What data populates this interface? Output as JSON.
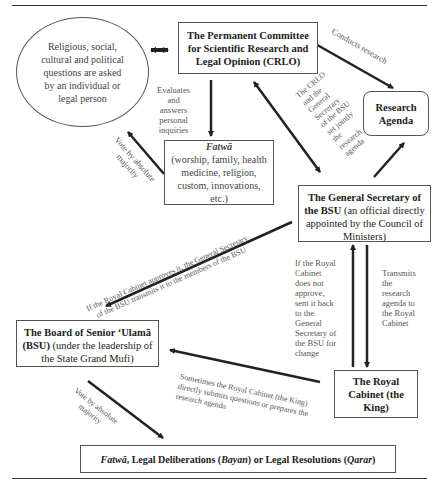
{
  "nodes": {
    "question": {
      "text": "Religious, social, cultural and political questions are asked by an individual or legal person"
    },
    "crlo": {
      "title": "The Permanent Committee for Scientific Research and Legal Opinion (CRLO)"
    },
    "research_agenda": {
      "title": "Research Agenda"
    },
    "fatwa": {
      "title": "Fatwā",
      "detail": "(worship, family, health medicine, religion, custom, innovations, etc.)"
    },
    "general_secretary": {
      "title": "The General Secretary of the BSU",
      "detail": "(an official directly appointed by the Council of Ministers)"
    },
    "bsu": {
      "title": "The Board of Senior ‘Ulamā (BSU)",
      "detail": "(under the leadership of the State Grand Mufi)"
    },
    "royal_cabinet": {
      "title": "The Royal Cabinet (the King)"
    },
    "output": {
      "fatwa": "Fatwā",
      "mid1": ", Legal Deliberations (",
      "bayan": "Bayan",
      "mid2": ") or Legal Resolutions (",
      "qarar": "Qarar",
      "end": ")"
    }
  },
  "edge_labels": {
    "evaluates": "Evaluates\nand\nanswers\npersonal\ninquiries",
    "conducts": "Conducts research",
    "vote_top": "Vote by absolute\nmajority",
    "crlo_gs": "The CRLO\nand the\nGeneral\nSecretary\nof the BSU\nset jointly\nthe\nresearch\nagenda",
    "approves": "If the Royal Cabinet approves it, the General Secretary\nof the BSU transmits it to the members of the BSU",
    "not_approve": "If the Royal\nCabinet\ndoes not\napprove,\nsent it back\nto the\nGeneral\nSecretary of\nthe BSU for\nchange",
    "transmits": "Transmits\nthe\nresearch\nagenda to\nthe Royal\nCabinet",
    "sometimes": "Sometimes the Royal Cabinet (the King)\ndirectly submits questions or prepares the\nresearch agenda",
    "vote_bottom": "Vote by absolute\nmajority"
  }
}
